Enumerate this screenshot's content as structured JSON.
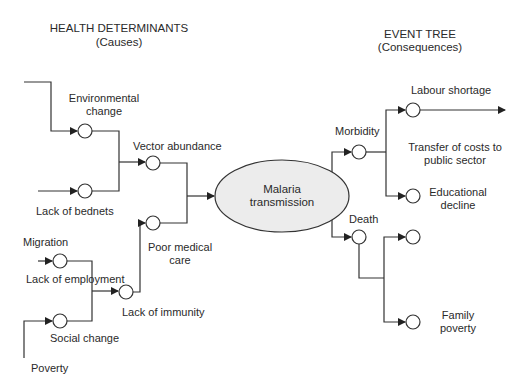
{
  "headers": {
    "causes_title": "HEALTH DETERMINANTS",
    "causes_subtitle": "(Causes)",
    "consequences_title": "EVENT TREE",
    "consequences_subtitle": "(Consequences)"
  },
  "center": {
    "line1": "Malaria",
    "line2": "transmission",
    "fill": "#ececec"
  },
  "causes": {
    "environmental_change": [
      "Environmental",
      "change"
    ],
    "lack_of_bednets": "Lack of bednets",
    "vector_abundance": "Vector abundance",
    "poor_medical_care": [
      "Poor medical",
      "care"
    ],
    "migration": "Migration",
    "lack_of_employment": "Lack of employment",
    "lack_of_immunity": "Lack of immunity",
    "social_change": "Social change",
    "poverty": "Poverty"
  },
  "consequences": {
    "morbidity": "Morbidity",
    "death": "Death",
    "labour_shortage": "Labour shortage",
    "transfer_of_costs": [
      "Transfer of costs to",
      "public sector"
    ],
    "educational_decline": [
      "Educational",
      "decline"
    ],
    "family_poverty": [
      "Family",
      "poverty"
    ]
  },
  "style": {
    "line_color": "#333333"
  }
}
